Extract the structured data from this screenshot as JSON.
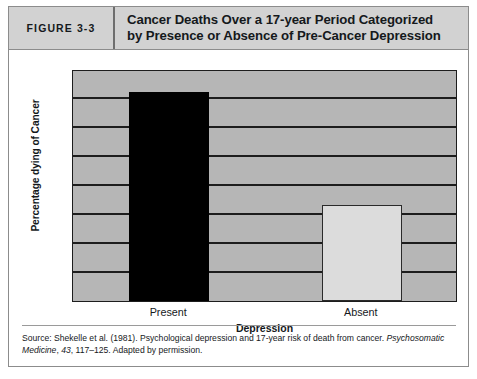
{
  "figure": {
    "number_label": "FIGURE 3-3",
    "title_line1": "Cancer Deaths Over a 17-year Period Categorized",
    "title_line2": "by Presence or Absence of Pre-Cancer Depression"
  },
  "source": {
    "prefix": "Source: Shekelle et al. (1981). Psychological depression and 17-year risk of death from cancer. ",
    "journal": "Psychosomatic Medicine",
    "volume": "43",
    "suffix": ", 117–125. Adapted by permission.",
    "comma": ", "
  },
  "colors": {
    "header_band": "#d2d2d2",
    "plot_background": "#b6b6b6",
    "gridline": "#1d1d1d",
    "bar_present": "#000000",
    "bar_absent": "#dcdcdc",
    "box_border": "#8c8c8c",
    "text": "#15191c"
  },
  "chart_data": {
    "type": "bar",
    "title": "Cancer Deaths Over a 17-year Period Categorized by Presence or Absence of Pre-Cancer Depression",
    "xlabel": "Depression",
    "ylabel": "Percentage dying of Cancer",
    "categories": [
      "Present",
      "Absent"
    ],
    "values": [
      7.2,
      3.3
    ],
    "ylim": [
      0,
      8
    ],
    "yticks": [
      0,
      1,
      2,
      3,
      4,
      5,
      6,
      7,
      8
    ],
    "ytick_labels": [
      "0",
      "1",
      "2",
      "3",
      "4",
      "5",
      "6",
      "7",
      "8"
    ],
    "grid": true,
    "legend": "none",
    "series": [
      {
        "name": "Percentage dying of Cancer",
        "values": [
          7.2,
          3.3
        ]
      }
    ],
    "bar_colors": [
      "#000000",
      "#dcdcdc"
    ]
  }
}
